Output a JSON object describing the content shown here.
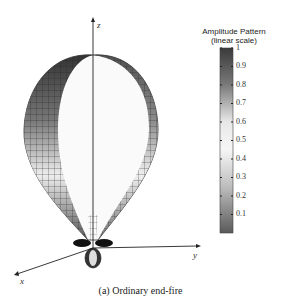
{
  "figure": {
    "caption": "(a) Ordinary end-fire",
    "axes": {
      "x": "x",
      "y": "y",
      "z": "z"
    }
  },
  "colorbar": {
    "title_line1": "Amplitude Pattern",
    "title_line2": "(linear scale)",
    "ticks": [
      "1",
      "0.9",
      "0.8",
      "0.7",
      "0.6",
      "0.5",
      "0.4",
      "0.3",
      "0.2",
      "0.1"
    ],
    "colors": {
      "top": "#3a3a3a",
      "middle": "#f4f4f4",
      "bottom": "#5a5a5a"
    }
  }
}
